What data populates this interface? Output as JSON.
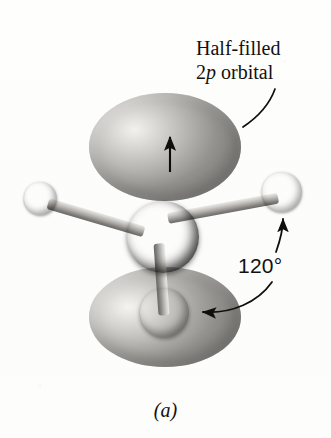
{
  "figure": {
    "caption": "(a)"
  },
  "labels": {
    "orbital": {
      "line1": "Half-filled",
      "line2_prefix": "2",
      "line2_italic": "p",
      "line2_suffix": " orbital"
    },
    "angle": "120°"
  },
  "colors": {
    "background": "#fdfdfc",
    "lobe_gray": "#a5a4a0",
    "lobe_highlight": "#f2f1ef",
    "central_atom": "#000000",
    "bonded_atom": "#8e8d8a",
    "bond_gray": "#a9a8a4",
    "ink": "#111110"
  },
  "parts": {
    "lobe_top": "upper p-orbital lobe",
    "lobe_bottom": "lower p-orbital lobe",
    "atom_center": "central atom",
    "atom_left": "left bonded atom",
    "atom_right": "right bonded atom",
    "atom_bottom": "bottom bonded atom",
    "bond_left": "bond to left atom",
    "bond_right": "bond to right atom",
    "bond_bottom": "bond to bottom atom",
    "spin_arrow": "single electron spin arrow",
    "leader_orbital": "leader line to orbital label",
    "arrow_angle_right": "angle arrow to right bond",
    "arrow_angle_bottom": "angle arrow to bottom bond"
  }
}
